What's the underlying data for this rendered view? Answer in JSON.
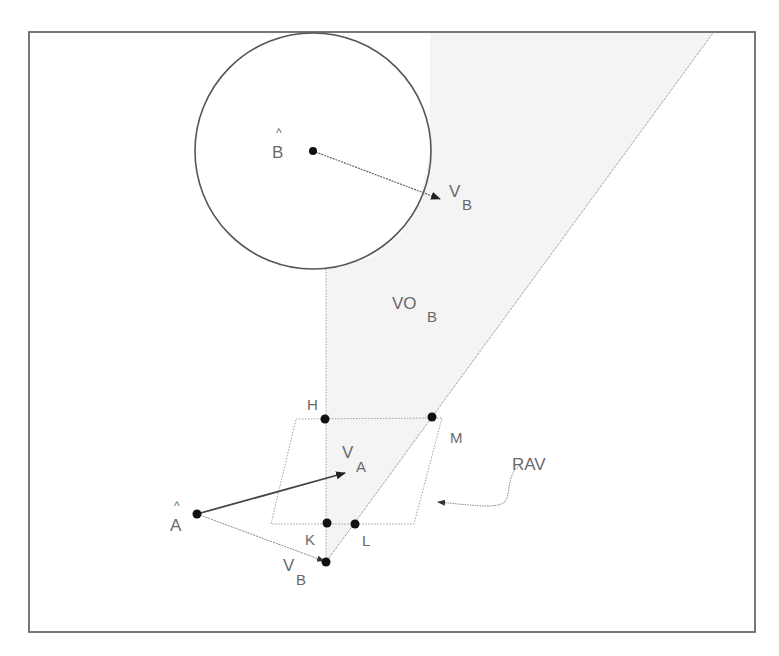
{
  "diagram": {
    "type": "velocity-obstacle",
    "colors": {
      "frame": "#555555",
      "circle": "#555555",
      "cone_fill": "#f3f3f3",
      "line": "#9a9a9a",
      "dot": "#111111",
      "text": "#6a6a6a"
    },
    "labels": {
      "b_hat": "B",
      "b_hat_accent": "^",
      "a_hat": "A",
      "a_hat_accent": "^",
      "vb_top_main": "V",
      "vb_top_sub": "B",
      "vo_main": "VO",
      "vo_sub": "B",
      "h": "H",
      "m": "M",
      "k": "K",
      "l": "L",
      "va_main": "V",
      "va_sub": "A",
      "vb_bottom_main": "V",
      "vb_bottom_sub": "B",
      "rav": "RAV"
    },
    "points": {
      "B": [
        313,
        151
      ],
      "A": [
        197,
        514
      ],
      "H": [
        325,
        419
      ],
      "M": [
        432,
        417
      ],
      "K": [
        327,
        523
      ],
      "L": [
        355,
        524
      ],
      "VB_apex": [
        326,
        562
      ]
    },
    "circle": {
      "cx": 313,
      "cy": 151,
      "r": 118
    },
    "rav_parallelogram": [
      [
        296,
        419
      ],
      [
        442,
        418
      ],
      [
        414,
        524
      ],
      [
        271,
        524
      ]
    ]
  }
}
